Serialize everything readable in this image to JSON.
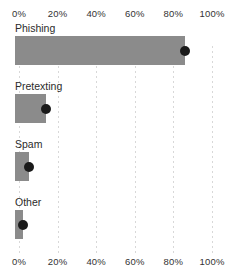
{
  "chart_data": {
    "type": "bar",
    "orientation": "horizontal",
    "title": "",
    "xlabel": "",
    "ylabel": "",
    "categories": [
      "Phishing",
      "Pretexting",
      "Spam",
      "Other"
    ],
    "values": [
      86,
      14,
      5,
      2
    ],
    "series": [
      {
        "name": "percentage",
        "values": [
          86,
          14,
          5,
          2
        ],
        "marker": "dot"
      }
    ],
    "xlim": [
      0,
      100
    ],
    "tick_values": [
      0,
      20,
      40,
      60,
      80,
      100
    ],
    "tick_labels": [
      "0%",
      "20%",
      "40%",
      "60%",
      "80%",
      "100%"
    ],
    "grid": true,
    "grid_axis": "x",
    "grid_style": "dotted",
    "legend": false,
    "axis_positions": [
      "top",
      "bottom"
    ],
    "colors": {
      "bar": "#8b8b8b",
      "marker": "#1a1a1a",
      "grid": "#d8d8d8",
      "text": "#2b2b2b",
      "background": "#ffffff"
    }
  },
  "axis": {
    "ticks": [
      {
        "label": "0%",
        "value": 0
      },
      {
        "label": "20%",
        "value": 20
      },
      {
        "label": "40%",
        "value": 40
      },
      {
        "label": "60%",
        "value": 60
      },
      {
        "label": "80%",
        "value": 80
      },
      {
        "label": "100%",
        "value": 100
      }
    ]
  },
  "rows": [
    {
      "label": "Phishing",
      "value": 86
    },
    {
      "label": "Pretexting",
      "value": 14
    },
    {
      "label": "Spam",
      "value": 5
    },
    {
      "label": "Other",
      "value": 2
    }
  ]
}
